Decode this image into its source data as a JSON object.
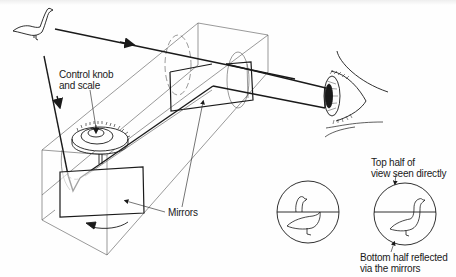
{
  "figure": {
    "labels": {
      "control_knob": [
        "Control knob",
        "and scale"
      ],
      "mirrors": "Mirrors",
      "top_half": [
        "Top half of",
        "view seen directly"
      ],
      "bottom_half": [
        "Bottom half reflected",
        "via the mirrors"
      ]
    },
    "elements": [
      "bird (subject)",
      "direct light ray with arrow",
      "reflected light ray with arrow",
      "transparent box housing",
      "rotating lower mirror with control knob and scale",
      "fixed upper mirror",
      "viewer eye",
      "rotation arrow",
      "viewfinder circle: misaligned split image",
      "viewfinder circle: aligned image"
    ],
    "colors": {
      "ink": "#1a1a1a",
      "thin_line": "#555555",
      "background": "#fefefe"
    }
  }
}
